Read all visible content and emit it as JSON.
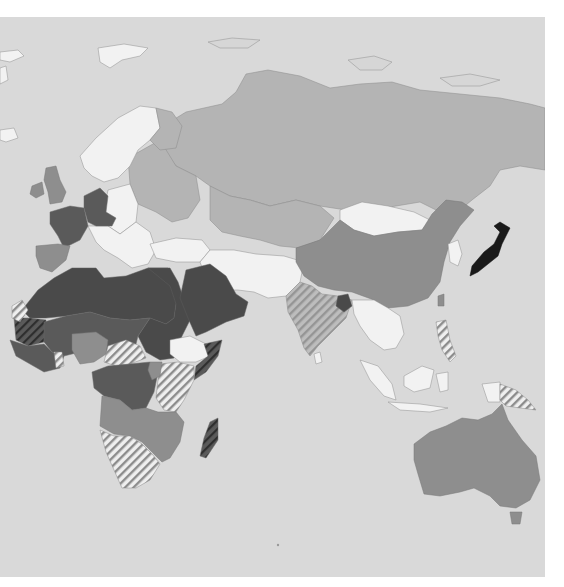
{
  "map": {
    "type": "choropleth",
    "region": "Eastern Hemisphere (Europe, Africa, Asia, Oceania)",
    "background_color": "#d9d9d9",
    "page_color": "#ffffff",
    "classes": [
      {
        "id": "black",
        "color": "#1a1a1a",
        "countries": [
          "Japan"
        ]
      },
      {
        "id": "darker",
        "color": "#4a4a4a",
        "countries": [
          "Morocco",
          "Algeria",
          "Tunisia",
          "Libya",
          "Egypt",
          "Sudan",
          "Saudi Arabia",
          "Yemen",
          "Oman",
          "Bangladesh"
        ]
      },
      {
        "id": "dark",
        "color": "#5a5a5a",
        "countries": [
          "France",
          "Germany",
          "Switzerland",
          "Austria",
          "Mali",
          "Niger",
          "Chad",
          "Senegal",
          "Guinea",
          "Democratic Republic of the Congo",
          "Republic of the Congo",
          "Cameroon",
          "Gabon",
          "Central African Republic",
          "Burkina Faso"
        ]
      },
      {
        "id": "mid",
        "color": "#8e8e8e",
        "countries": [
          "United Kingdom",
          "Ireland",
          "Spain",
          "China",
          "Australia",
          "Nigeria",
          "Angola",
          "Zambia",
          "Zimbabwe",
          "Mozambique",
          "Tanzania",
          "Rwanda",
          "Uganda"
        ]
      },
      {
        "id": "light",
        "color": "#b4b4b4",
        "countries": [
          "Russia",
          "Kazakhstan",
          "Eastern Europe",
          "Finland",
          "Baltics",
          "Ukraine",
          "Belarus"
        ]
      },
      {
        "id": "white",
        "color": "#f2f2f2",
        "countries": [
          "Norway",
          "Sweden",
          "Poland",
          "Balkans",
          "Italy",
          "Turkey",
          "Iran",
          "Afghanistan",
          "Pakistan",
          "Mongolia",
          "Ethiopia",
          "Myanmar",
          "Thailand",
          "Vietnam",
          "Indonesia",
          "Malaysia",
          "Korea"
        ]
      },
      {
        "id": "hatched",
        "color": "striped",
        "countries": [
          "India",
          "Kenya",
          "Somalia",
          "South Africa",
          "Namibia",
          "Botswana",
          "Madagascar",
          "Papua New Guinea",
          "Philippines",
          "Mauritania",
          "Western Sahara",
          "Ghana",
          "South Sudan",
          "Nepal"
        ]
      }
    ],
    "legend": null,
    "title": null
  }
}
